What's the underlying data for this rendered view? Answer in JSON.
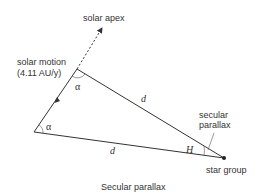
{
  "diagram": {
    "caption": "Secular parallax",
    "labels": {
      "solar_apex": "solar apex",
      "solar_motion_line1": "solar motion",
      "solar_motion_line2": "(4.11 AU/y)",
      "alpha_top": "α",
      "alpha_bottom": "α",
      "d_top": "d",
      "d_bottom": "d",
      "H": "H",
      "secular_parallax_line1": "secular",
      "secular_parallax_line2": "parallax",
      "star_group": "star group"
    },
    "colors": {
      "line": "#333333",
      "text": "#333333",
      "background": "#ffffff"
    }
  }
}
